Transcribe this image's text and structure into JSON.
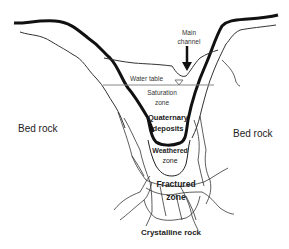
{
  "diagram": {
    "labels": {
      "main_channel_line1": "Main",
      "main_channel_line2": "channel",
      "water_table": "Water table",
      "saturation_line1": "Saturation",
      "saturation_line2": "zone",
      "quaternary_line1": "Quaternary",
      "quaternary_line2": "deposits",
      "weathered_line1": "Weathered",
      "weathered_line2": "zone",
      "fractured_line1": "Fractured",
      "fractured_line2": "zone",
      "bedrock_left": "Bed rock",
      "bedrock_right": "Bed rock",
      "crystalline": "Crystalline rock"
    },
    "icons": {
      "arrow": "down-arrow-icon",
      "water_table_marker": "inverted-triangle-icon"
    },
    "colors": {
      "line": "#111111",
      "thin_line": "#333333",
      "water_table_line": "#888888",
      "background": "#ffffff"
    }
  }
}
